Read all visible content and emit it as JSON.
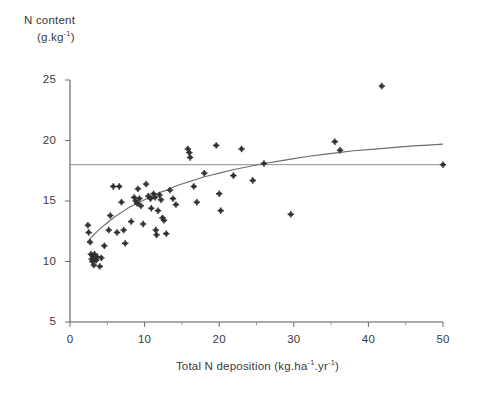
{
  "chart_data": {
    "type": "scatter",
    "title": "",
    "ylabel_line1": "N content",
    "ylabel_line2_prefix": "(g.kg",
    "ylabel_line2_exp": "-1",
    "ylabel_line2_suffix": ")",
    "xlabel_prefix": "Total N deposition (kg.ha",
    "xlabel_exp1": "-1",
    "xlabel_mid": ".yr",
    "xlabel_exp2": "-1",
    "xlabel_suffix": ")",
    "xlabel_full": "Total N deposition (kg.ha-1.yr-1)",
    "ylabel_full": "N content (g.kg-1)",
    "xlim": [
      0,
      50
    ],
    "ylim": [
      5,
      25
    ],
    "xticks": [
      0,
      10,
      20,
      30,
      40,
      50
    ],
    "xticks_minor": [
      5,
      15,
      25,
      35,
      45
    ],
    "yticks": [
      5,
      10,
      15,
      20,
      25
    ],
    "xtick_labels": [
      "0",
      "10",
      "20",
      "30",
      "40",
      "50"
    ],
    "ytick_labels": [
      "5",
      "10",
      "15",
      "20",
      "25"
    ],
    "grid": false,
    "legend": "none",
    "marker_style": "plus-cross",
    "marker_color": "#303030",
    "curve_color": "#6d6d6d",
    "reference_line_color": "#8e8e8e",
    "axis_color": "#5a5a5a",
    "reference_line": {
      "orientation": "horizontal",
      "y": 18.0,
      "label": ""
    },
    "fit_curve": {
      "description": "asymptotic/logarithmic fitted trend",
      "points": [
        [
          2.3,
          11.6
        ],
        [
          3.0,
          12.1
        ],
        [
          4.0,
          12.7
        ],
        [
          5.0,
          13.2
        ],
        [
          6.0,
          13.7
        ],
        [
          7.0,
          14.1
        ],
        [
          8.0,
          14.5
        ],
        [
          9.0,
          14.8
        ],
        [
          10.0,
          15.1
        ],
        [
          11.0,
          15.4
        ],
        [
          12.0,
          15.7
        ],
        [
          13.0,
          15.9
        ],
        [
          14.0,
          16.2
        ],
        [
          15.0,
          16.4
        ],
        [
          16.0,
          16.6
        ],
        [
          17.0,
          16.8
        ],
        [
          18.0,
          17.0
        ],
        [
          19.0,
          17.15
        ],
        [
          20.0,
          17.3
        ],
        [
          22.0,
          17.6
        ],
        [
          24.0,
          17.85
        ],
        [
          26.0,
          18.1
        ],
        [
          28.0,
          18.3
        ],
        [
          30.0,
          18.5
        ],
        [
          32.0,
          18.7
        ],
        [
          34.0,
          18.85
        ],
        [
          36.0,
          19.0
        ],
        [
          38.0,
          19.15
        ],
        [
          40.0,
          19.25
        ],
        [
          42.0,
          19.35
        ],
        [
          44.0,
          19.45
        ],
        [
          46.0,
          19.55
        ],
        [
          48.0,
          19.62
        ],
        [
          50.0,
          19.7
        ]
      ]
    },
    "points": [
      [
        2.4,
        13.0
      ],
      [
        2.5,
        12.4
      ],
      [
        2.7,
        11.6
      ],
      [
        2.8,
        10.6
      ],
      [
        2.9,
        10.2
      ],
      [
        3.0,
        10.5
      ],
      [
        3.0,
        10.0
      ],
      [
        3.1,
        10.4
      ],
      [
        3.2,
        10.3
      ],
      [
        3.2,
        9.7
      ],
      [
        3.3,
        10.6
      ],
      [
        3.4,
        10.2
      ],
      [
        3.5,
        10.1
      ],
      [
        3.6,
        10.4
      ],
      [
        4.0,
        9.6
      ],
      [
        4.2,
        10.3
      ],
      [
        4.6,
        11.3
      ],
      [
        5.2,
        12.6
      ],
      [
        5.4,
        13.8
      ],
      [
        5.8,
        16.2
      ],
      [
        6.3,
        12.4
      ],
      [
        6.6,
        16.2
      ],
      [
        6.9,
        14.9
      ],
      [
        7.2,
        12.6
      ],
      [
        7.4,
        11.5
      ],
      [
        8.2,
        13.3
      ],
      [
        8.6,
        15.3
      ],
      [
        8.8,
        15.0
      ],
      [
        9.0,
        14.8
      ],
      [
        9.1,
        16.0
      ],
      [
        9.3,
        15.2
      ],
      [
        9.5,
        14.6
      ],
      [
        9.8,
        13.1
      ],
      [
        10.2,
        16.4
      ],
      [
        10.5,
        15.4
      ],
      [
        10.8,
        15.2
      ],
      [
        10.9,
        14.4
      ],
      [
        11.2,
        15.6
      ],
      [
        11.4,
        15.3
      ],
      [
        11.5,
        12.6
      ],
      [
        11.6,
        12.2
      ],
      [
        11.8,
        14.2
      ],
      [
        12.0,
        15.5
      ],
      [
        12.2,
        15.1
      ],
      [
        12.4,
        13.6
      ],
      [
        12.6,
        13.4
      ],
      [
        12.9,
        12.3
      ],
      [
        13.4,
        15.9
      ],
      [
        13.8,
        15.2
      ],
      [
        14.2,
        14.7
      ],
      [
        15.8,
        19.3
      ],
      [
        16.0,
        19.0
      ],
      [
        16.1,
        18.6
      ],
      [
        16.6,
        16.2
      ],
      [
        17.0,
        14.9
      ],
      [
        18.0,
        17.3
      ],
      [
        19.6,
        19.6
      ],
      [
        20.0,
        15.6
      ],
      [
        20.2,
        14.2
      ],
      [
        21.9,
        17.1
      ],
      [
        23.0,
        19.3
      ],
      [
        24.5,
        16.7
      ],
      [
        26.0,
        18.1
      ],
      [
        29.6,
        13.9
      ],
      [
        35.5,
        19.9
      ],
      [
        36.2,
        19.2
      ],
      [
        41.8,
        24.5
      ],
      [
        50.0,
        18.0
      ]
    ]
  }
}
